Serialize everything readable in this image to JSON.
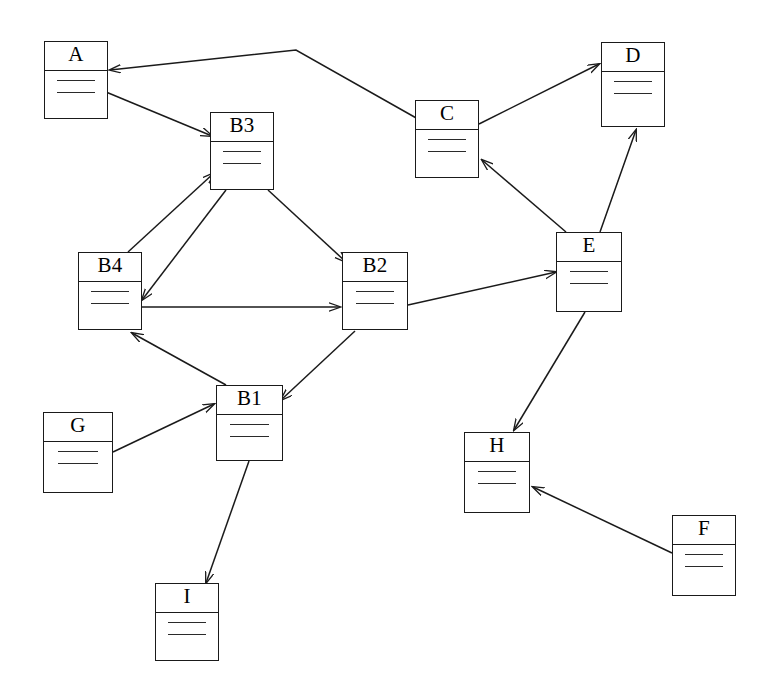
{
  "diagram": {
    "background_color": "#ffffff",
    "stroke_color": "#1a1a1a",
    "attribute_line_count": 2,
    "nodes": [
      {
        "id": "A",
        "label": "A",
        "x": 44,
        "y": 41,
        "w": 64,
        "h": 78,
        "title_h": 29
      },
      {
        "id": "B3",
        "label": "B3",
        "x": 210,
        "y": 112,
        "w": 64,
        "h": 78,
        "title_h": 29
      },
      {
        "id": "C",
        "label": "C",
        "x": 415,
        "y": 100,
        "w": 64,
        "h": 78,
        "title_h": 29
      },
      {
        "id": "D",
        "label": "D",
        "x": 601,
        "y": 42,
        "w": 64,
        "h": 85,
        "title_h": 29
      },
      {
        "id": "B4",
        "label": "B4",
        "x": 78,
        "y": 252,
        "w": 64,
        "h": 78,
        "title_h": 29
      },
      {
        "id": "B2",
        "label": "B2",
        "x": 342,
        "y": 252,
        "w": 66,
        "h": 78,
        "title_h": 29
      },
      {
        "id": "E",
        "label": "E",
        "x": 556,
        "y": 232,
        "w": 66,
        "h": 80,
        "title_h": 29
      },
      {
        "id": "B1",
        "label": "B1",
        "x": 216,
        "y": 385,
        "w": 67,
        "h": 76,
        "title_h": 29
      },
      {
        "id": "G",
        "label": "G",
        "x": 43,
        "y": 412,
        "w": 70,
        "h": 81,
        "title_h": 29
      },
      {
        "id": "H",
        "label": "H",
        "x": 464,
        "y": 432,
        "w": 66,
        "h": 81,
        "title_h": 29
      },
      {
        "id": "F",
        "label": "F",
        "x": 672,
        "y": 515,
        "w": 64,
        "h": 81,
        "title_h": 29
      },
      {
        "id": "I",
        "label": "I",
        "x": 155,
        "y": 583,
        "w": 64,
        "h": 78,
        "title_h": 29
      }
    ],
    "edges": [
      {
        "from": "C",
        "to": "A",
        "points": "418,119 296,50 110,70"
      },
      {
        "from": "A",
        "to": "B3",
        "points": "106,92 212,136"
      },
      {
        "from": "B4",
        "to": "B3",
        "points": "128,252 214,173"
      },
      {
        "from": "B3",
        "to": "B4",
        "points": "226,190 142,300"
      },
      {
        "from": "B3",
        "to": "B2",
        "points": "268,190 346,262"
      },
      {
        "from": "B4",
        "to": "B2",
        "points": "141,307 340,307"
      },
      {
        "from": "B1",
        "to": "B4",
        "points": "226,385 132,333"
      },
      {
        "from": "G",
        "to": "B1",
        "points": "113,452 214,404"
      },
      {
        "from": "B2",
        "to": "B1",
        "points": "355,331 281,400"
      },
      {
        "from": "B1",
        "to": "I",
        "points": "249,461 206,583"
      },
      {
        "from": "B2",
        "to": "E",
        "points": "408,305 556,272"
      },
      {
        "from": "E",
        "to": "C",
        "points": "566,232 482,160"
      },
      {
        "from": "E",
        "to": "D",
        "points": "600,232 636,130"
      },
      {
        "from": "C",
        "to": "D",
        "points": "479,124 599,64"
      },
      {
        "from": "E",
        "to": "H",
        "points": "585,312 514,430"
      },
      {
        "from": "F",
        "to": "H",
        "points": "672,553 533,487"
      }
    ]
  }
}
